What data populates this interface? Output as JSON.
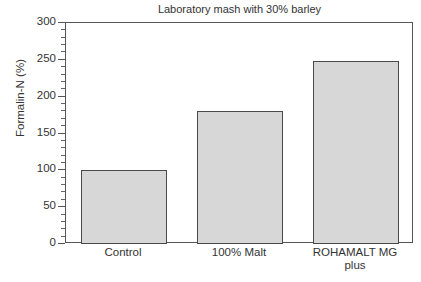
{
  "chart_data": {
    "type": "bar",
    "title": "Laboratory mash with 30% barley",
    "xlabel": "",
    "ylabel": "Formalin-N (%)",
    "categories": [
      "Control",
      "100% Malt",
      "ROHAMALT MG plus"
    ],
    "category_lines": [
      [
        "Control"
      ],
      [
        "100% Malt"
      ],
      [
        "ROHAMALT MG",
        "plus"
      ]
    ],
    "values": [
      100,
      180,
      248
    ],
    "ylim": [
      0,
      300
    ],
    "yticks": [
      0,
      50,
      100,
      150,
      200,
      250,
      300
    ],
    "ytick_labels": [
      "0",
      "50",
      "100",
      "150",
      "200",
      "250",
      "300"
    ],
    "yminor_step": 10,
    "grid": false,
    "legend": null,
    "bar_fill_color": "#d7d7d7",
    "bar_edge_color": "#4a4a4a",
    "axis_color": "#555555",
    "text_color": "#333333",
    "background_color": "#ffffff"
  }
}
